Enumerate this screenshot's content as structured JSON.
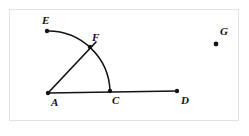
{
  "page": {
    "top_fragment": "",
    "caption": "",
    "background_color": "#ffffff",
    "frame_color": "#e2e2e2",
    "ink_color": "#111111"
  },
  "figure": {
    "type": "geometry-diagram",
    "points": [
      {
        "id": "A",
        "label": "A",
        "x": 48,
        "y": 93,
        "label_x": 51,
        "label_y": 97,
        "marked": true
      },
      {
        "id": "C",
        "label": "C",
        "x": 110,
        "y": 91,
        "label_x": 112,
        "label_y": 95,
        "marked": true
      },
      {
        "id": "D",
        "label": "D",
        "x": 177,
        "y": 91,
        "label_x": 181,
        "label_y": 95,
        "marked": true
      },
      {
        "id": "E",
        "label": "E",
        "x": 47,
        "y": 31,
        "label_x": 42,
        "label_y": 15,
        "marked": true
      },
      {
        "id": "F",
        "label": "F",
        "x": 90,
        "y": 47,
        "label_x": 92,
        "label_y": 32,
        "marked": true
      },
      {
        "id": "G",
        "label": "G",
        "x": 216,
        "y": 44,
        "label_x": 220,
        "label_y": 26,
        "marked": true
      }
    ],
    "segments": [
      {
        "id": "AD",
        "from": "A",
        "to": "D"
      },
      {
        "id": "AF",
        "from": "A",
        "to": "F_extended"
      }
    ],
    "ray_af_end": {
      "x": 96,
      "y": 42
    },
    "arc": {
      "id": "arc-EFC",
      "center": "A",
      "radius": 62,
      "from": "E",
      "through": "F",
      "to": "C"
    }
  }
}
